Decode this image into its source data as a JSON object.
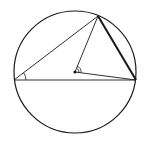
{
  "diagram": {
    "type": "geometry",
    "circle": {
      "cx": 75,
      "cy": 72,
      "r": 61
    },
    "center": {
      "x": 75,
      "y": 72
    },
    "vertices": {
      "A": {
        "x": 14,
        "y": 80
      },
      "B": {
        "x": 98,
        "y": 16
      },
      "C": {
        "x": 136,
        "y": 80
      }
    },
    "bold_chord": "BC",
    "angles_marked": [
      "inscribed angle at A",
      "central angle at center O"
    ],
    "stroke_color": "#1a1a1a",
    "background": "#ffffff"
  }
}
